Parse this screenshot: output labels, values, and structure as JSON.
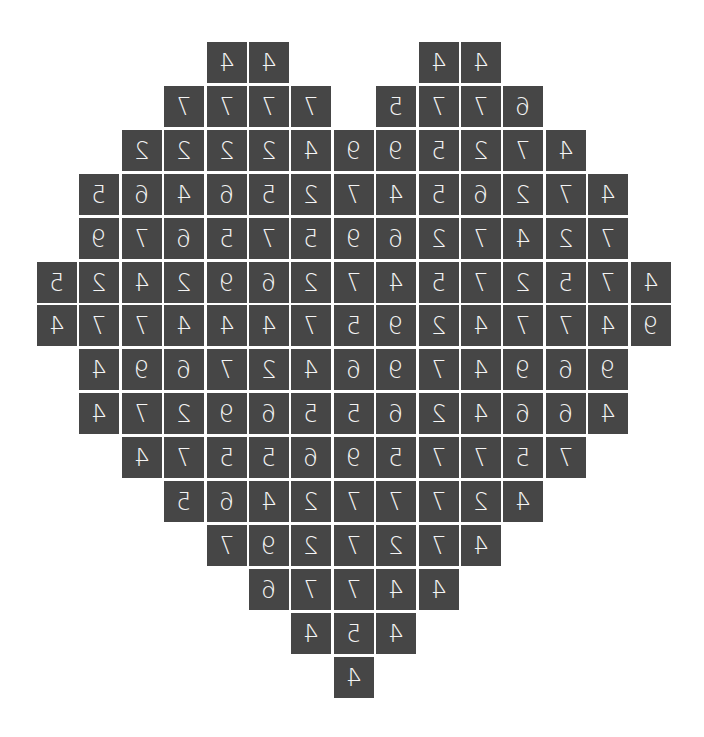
{
  "puzzle": {
    "shape": "heart",
    "digits_mirrored": true,
    "cell_color": "#464646",
    "text_color": "#f4f4f4",
    "rows": [
      {
        "start_col": 4,
        "values": [
          4,
          4
        ],
        "extra": [
          {
            "start_col": 9,
            "values": [
              4,
              4
            ]
          }
        ]
      },
      {
        "start_col": 3,
        "values": [
          7,
          7,
          7,
          7
        ],
        "extra": [
          {
            "start_col": 8,
            "values": [
              5,
              7,
              7,
              6
            ]
          }
        ]
      },
      {
        "start_col": 2,
        "values": [
          2,
          2,
          2,
          2,
          4,
          9,
          9,
          5,
          2,
          7,
          4
        ]
      },
      {
        "start_col": 1,
        "values": [
          5,
          6,
          4,
          6,
          5,
          2,
          7,
          4,
          5,
          6,
          2,
          7,
          4
        ]
      },
      {
        "start_col": 1,
        "values": [
          9,
          7,
          6,
          5,
          7,
          5,
          9,
          6,
          2,
          7,
          4,
          2,
          7
        ]
      },
      {
        "start_col": 0,
        "values": [
          5,
          2,
          4,
          2,
          9,
          6,
          2,
          7,
          4,
          5,
          7,
          2,
          5,
          7,
          4
        ]
      },
      {
        "start_col": 0,
        "values": [
          4,
          7,
          7,
          4,
          4,
          4,
          7,
          5,
          9,
          2,
          4,
          7,
          7,
          4,
          9
        ]
      },
      {
        "start_col": 1,
        "values": [
          4,
          9,
          6,
          7,
          2,
          4,
          6,
          9,
          7,
          4,
          9,
          6,
          9
        ]
      },
      {
        "start_col": 1,
        "values": [
          4,
          7,
          2,
          9,
          6,
          5,
          5,
          6,
          2,
          4,
          6,
          6,
          4
        ]
      },
      {
        "start_col": 2,
        "values": [
          4,
          7,
          5,
          5,
          6,
          9,
          5,
          7,
          7,
          5,
          7
        ]
      },
      {
        "start_col": 3,
        "values": [
          5,
          6,
          4,
          2,
          7,
          7,
          7,
          2,
          4
        ]
      },
      {
        "start_col": 4,
        "values": [
          7,
          9,
          2,
          7,
          2,
          7,
          4
        ]
      },
      {
        "start_col": 5,
        "values": [
          6,
          7,
          7,
          4,
          4
        ]
      },
      {
        "start_col": 6,
        "values": [
          4,
          5,
          4
        ]
      },
      {
        "start_col": 7,
        "values": [
          4
        ]
      }
    ]
  }
}
